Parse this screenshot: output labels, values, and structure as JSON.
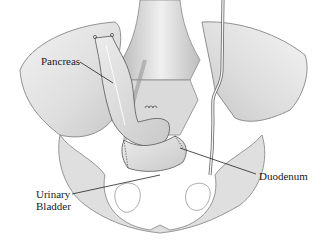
{
  "figure": {
    "labels": {
      "pancreas": "Pancreas",
      "duodenum": "Duodenum",
      "bladder_line1": "Urinary",
      "bladder_line2": "Bladder"
    }
  },
  "colors": {
    "background": "#ffffff",
    "bone_fill": "#e4e4e4",
    "bone_shade": "#cfcfcf",
    "outline": "#6e6e6e",
    "organ_fill": "#d9d9d9",
    "leader_line": "#222222",
    "text": "#1a1a1a"
  }
}
